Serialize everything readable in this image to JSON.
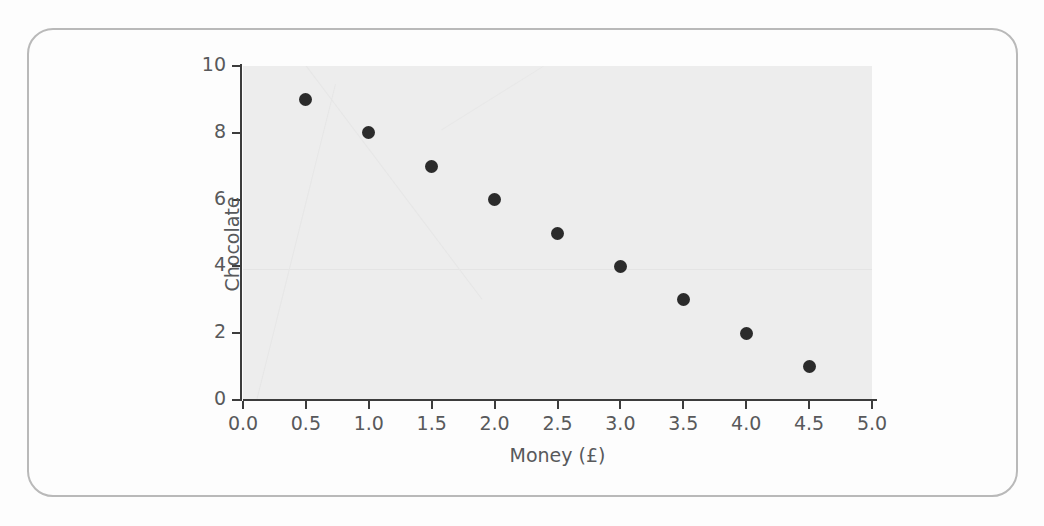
{
  "chart_data": {
    "type": "scatter",
    "title": "",
    "xlabel": "Money (£)",
    "ylabel": "Chocolate",
    "x": [
      0.5,
      1.0,
      1.5,
      2.0,
      2.5,
      3.0,
      3.5,
      4.0,
      4.5
    ],
    "values": [
      9,
      8,
      7,
      6,
      5,
      4,
      3,
      2,
      1
    ],
    "series": [
      {
        "name": "Chocolate vs Money",
        "points": [
          {
            "x": 0.5,
            "y": 9
          },
          {
            "x": 1.0,
            "y": 8
          },
          {
            "x": 1.5,
            "y": 7
          },
          {
            "x": 2.0,
            "y": 6
          },
          {
            "x": 2.5,
            "y": 5
          },
          {
            "x": 3.0,
            "y": 4
          },
          {
            "x": 3.5,
            "y": 3
          },
          {
            "x": 4.0,
            "y": 2
          },
          {
            "x": 4.5,
            "y": 1
          }
        ]
      }
    ],
    "xlim": [
      0.0,
      5.0
    ],
    "ylim": [
      0,
      10
    ],
    "xticks": [
      "0.0",
      "0.5",
      "1.0",
      "1.5",
      "2.0",
      "2.5",
      "3.0",
      "3.5",
      "4.0",
      "4.5",
      "5.0"
    ],
    "xtick_values": [
      0.0,
      0.5,
      1.0,
      1.5,
      2.0,
      2.5,
      3.0,
      3.5,
      4.0,
      4.5,
      5.0
    ],
    "yticks": [
      "0",
      "2",
      "4",
      "6",
      "8",
      "10"
    ],
    "ytick_values": [
      0,
      2,
      4,
      6,
      8,
      10
    ],
    "grid": false,
    "legend": null,
    "legend_position": "none",
    "marker_color": "#2b2b2b",
    "plot_background_color": "#ededed",
    "axis_color": "#3c3c3c",
    "text_color": "#58595b"
  },
  "frame": {
    "border_color": "#b9b9b9",
    "page_background": "#fdfdfd"
  }
}
